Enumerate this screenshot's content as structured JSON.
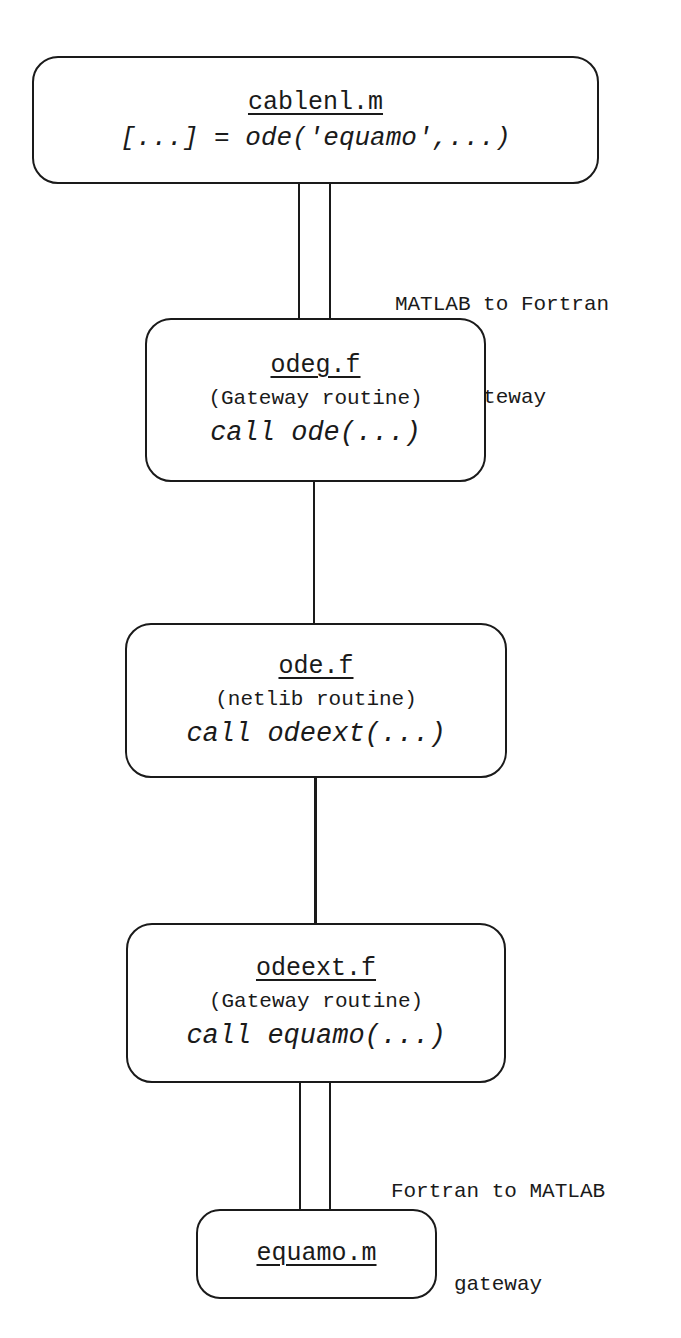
{
  "diagram": {
    "nodes": [
      {
        "id": "cablenl",
        "title": "cablenl.m",
        "call": "[...] = ode('equamo',...)"
      },
      {
        "id": "odeg",
        "title": "odeg.f",
        "subtitle": "(Gateway routine)",
        "call": "call ode(...)"
      },
      {
        "id": "ode",
        "title": "ode.f",
        "subtitle": "(netlib routine)",
        "call": "call odeext(...)"
      },
      {
        "id": "odeext",
        "title": "odeext.f",
        "subtitle": "(Gateway routine)",
        "call": "call equamo(...)"
      },
      {
        "id": "equamo",
        "title": "equamo.m"
      }
    ],
    "edges": [
      {
        "from": "cablenl",
        "to": "odeg",
        "style": "double",
        "label_line1": "MATLAB to Fortran",
        "label_line2": "gateway"
      },
      {
        "from": "odeg",
        "to": "ode",
        "style": "single"
      },
      {
        "from": "ode",
        "to": "odeext",
        "style": "single"
      },
      {
        "from": "odeext",
        "to": "equamo",
        "style": "double",
        "label_line1": "Fortran to MATLAB",
        "label_line2": "gateway"
      }
    ]
  }
}
